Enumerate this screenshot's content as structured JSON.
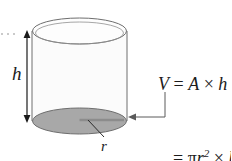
{
  "figure": {
    "type": "geometry-diagram",
    "labels": {
      "height": "h",
      "radius": "r"
    },
    "formula": {
      "line1": {
        "lhs": "V",
        "equals": "=",
        "area": "A",
        "times": "×",
        "height": "h"
      },
      "line2": {
        "equals": "=",
        "pi": "π",
        "radius": "r",
        "exponent": "2",
        "times": "×",
        "height": "h"
      }
    },
    "colors": {
      "outline": "#6e6e6e",
      "base_fill": "#a8a8a8",
      "body_fill": "#fbfbfb",
      "top_fill": "#fdfdfd",
      "leader": "#5a5a5a",
      "text": "#1b1b1b",
      "background": "#ffffff"
    },
    "geometry": {
      "cylinder_left_x": 32,
      "cylinder_right_x": 127,
      "top_ellipse_center_y": 31,
      "bottom_ellipse_center_y": 121,
      "ellipse_rx": 47,
      "ellipse_ry": 13
    },
    "annotations": {
      "height_arrow": "double-headed vertical arrow spanning the cylinder height",
      "radius_segment": "horizontal segment from base center to base rim",
      "formula_leader": "elbow leader from the pi-r-squared term to the shaded base"
    }
  }
}
